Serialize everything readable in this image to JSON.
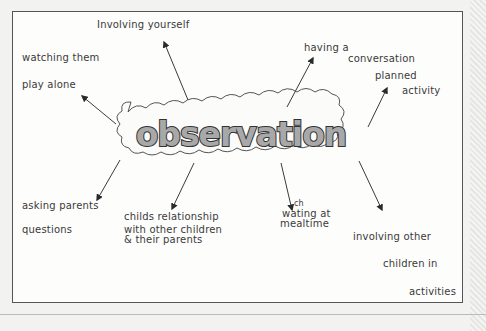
{
  "diagram": {
    "type": "mind-map",
    "central_node": {
      "label": "observation"
    },
    "branches": [
      {
        "id": "involving-yourself",
        "lines": [
          "Involving yourself"
        ]
      },
      {
        "id": "watching-play-alone",
        "lines": [
          "watching them",
          "play alone"
        ]
      },
      {
        "id": "having-conversation",
        "lines": [
          "having a",
          "conversation"
        ]
      },
      {
        "id": "planned-activity",
        "lines": [
          "planned",
          "activity"
        ]
      },
      {
        "id": "asking-parents-questions",
        "lines": [
          "asking parents",
          "questions"
        ]
      },
      {
        "id": "childs-relationship",
        "lines": [
          "childs relationship",
          "with other children",
          "& their parents"
        ]
      },
      {
        "id": "watching-mealtime",
        "lines": [
          "ch",
          "wating at",
          "mealtime"
        ]
      },
      {
        "id": "involving-other-children",
        "lines": [
          "involving other",
          "children   in",
          "activities"
        ]
      }
    ]
  },
  "colors": {
    "ink": "#3a3a3a",
    "title_fill": "#a8a8a8",
    "title_stroke": "#333333",
    "cloud_stroke": "#555555",
    "frame": "#555555",
    "paper": "#fdfdfc"
  }
}
